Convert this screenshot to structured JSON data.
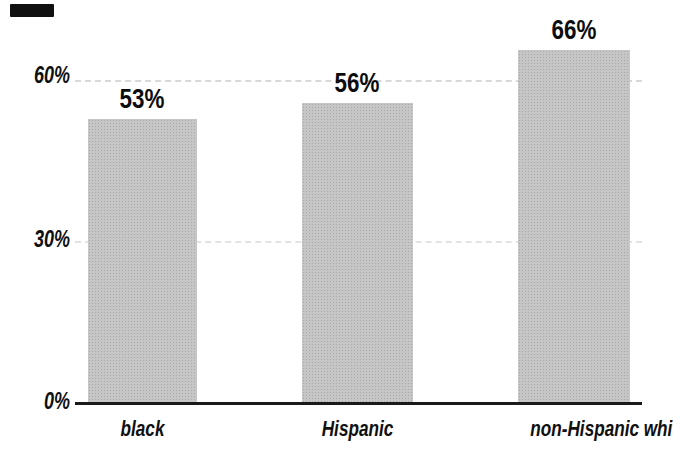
{
  "figure": {
    "background_color": "#ffffff",
    "text_color": "#101010",
    "scan_artifact": "black-mark-top-left"
  },
  "chart_data": {
    "type": "bar",
    "title": "",
    "xlabel": "",
    "ylabel": "",
    "categories": [
      "black",
      "Hispanic",
      "non-Hispanic white"
    ],
    "values": [
      53,
      56,
      66
    ],
    "value_labels": [
      "53%",
      "56%",
      "66%"
    ],
    "y_ticks": [
      {
        "value": 0,
        "label": "0%"
      },
      {
        "value": 30,
        "label": "30%"
      },
      {
        "value": 60,
        "label": "60%"
      }
    ],
    "ylim": [
      0,
      75
    ],
    "grid": "faint dashed horizontal gridlines at 30% and 60%",
    "legend": "none",
    "bar_color": "#bdbdbd",
    "axis_color": "#1a1a1a"
  }
}
